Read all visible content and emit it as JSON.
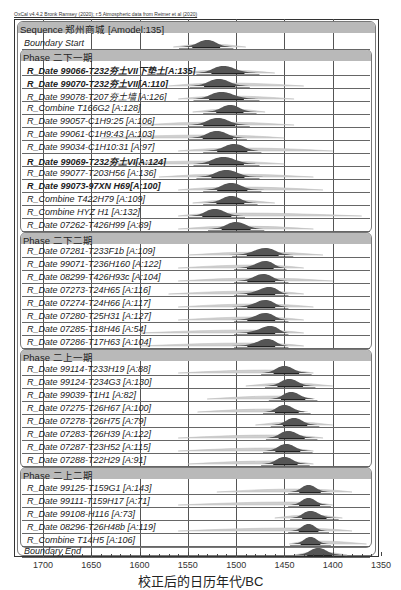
{
  "credit": "OxCal v4.4.2 Bronk Ramsey (2020); r:5 Atmospheric data from Reimer et al (2020)",
  "chart_data": {
    "type": "oxcal-multiplot",
    "xlabel": "校正后的日历年代/BC",
    "xlim": [
      1700,
      1350
    ],
    "ticks": [
      1700,
      1650,
      1600,
      1550,
      1500,
      1450,
      1400,
      1350
    ],
    "grid": true,
    "sequence": {
      "label": "Sequence 郑州商城 [Amodel:135]"
    },
    "rows": [
      {
        "kind": "boundary",
        "label": "Boundary Start",
        "y": 44,
        "center": 1530,
        "from": 1555,
        "to": 1507,
        "prior_from": 1565,
        "prior_to": 1490
      },
      {
        "kind": "phase",
        "label": "Phase 二下一期",
        "y": 56
      },
      {
        "kind": "date",
        "label": "R_Date 99066-T232夯土VII下垫土[A:135]",
        "bold": true,
        "y": 70,
        "center": 1513,
        "from": 1537,
        "to": 1480,
        "prior_from": 1560,
        "prior_to": 1460
      },
      {
        "kind": "date",
        "label": "R_Date 99070-T232夯土VII[A:110]",
        "bold": true,
        "y": 83,
        "center": 1518,
        "from": 1544,
        "to": 1490,
        "prior_from": 1570,
        "prior_to": 1430
      },
      {
        "kind": "date",
        "label": "R_Date 99078-T207夯土墙 [A:126]",
        "y": 96,
        "center": 1515,
        "from": 1540,
        "to": 1480,
        "prior_from": 1560,
        "prior_to": 1440
      },
      {
        "kind": "combine",
        "label": "R_Combine T166G2 [A:128]",
        "y": 109,
        "center": 1506,
        "from": 1530,
        "to": 1483,
        "prior_from": 1545,
        "prior_to": 1470
      },
      {
        "kind": "date",
        "label": "R_Date 99057-C1H9:25 [A:106]",
        "y": 122,
        "center": 1519,
        "from": 1545,
        "to": 1490,
        "prior_from": 1600,
        "prior_to": 1440
      },
      {
        "kind": "date",
        "label": "R_Date 99061-C1H9:43 [A:103]",
        "y": 135,
        "center": 1520,
        "from": 1545,
        "to": 1493,
        "prior_from": 1640,
        "prior_to": 1450
      },
      {
        "kind": "date",
        "label": "R_Date 99034-C1H10:31 [A:97]",
        "y": 148,
        "center": 1502,
        "from": 1530,
        "to": 1478,
        "prior_from": 1560,
        "prior_to": 1400
      },
      {
        "kind": "date",
        "label": "R_Date 99069-T232夯土VI[A:124]",
        "bold": true,
        "y": 161,
        "center": 1513,
        "from": 1540,
        "to": 1480,
        "prior_from": 1640,
        "prior_to": 1450
      },
      {
        "kind": "date",
        "label": "R_Date 99077-T203H56 [A:136]",
        "y": 174,
        "center": 1510,
        "from": 1537,
        "to": 1480,
        "prior_from": 1580,
        "prior_to": 1420
      },
      {
        "kind": "date",
        "label": "R_Date 99073-97XN H69[A:100]",
        "bold": true,
        "y": 187,
        "center": 1505,
        "from": 1530,
        "to": 1478,
        "prior_from": 1560,
        "prior_to": 1410
      },
      {
        "kind": "combine",
        "label": "R_Combine T422H79 [A:109]",
        "y": 200,
        "center": 1505,
        "from": 1530,
        "to": 1482,
        "prior_from": 1545,
        "prior_to": 1460
      },
      {
        "kind": "combine",
        "label": "R_Combine HYZ H1 [A:132]",
        "y": 213,
        "center": 1522,
        "from": 1545,
        "to": 1495,
        "prior_from": 1560,
        "prior_to": 1370
      },
      {
        "kind": "date",
        "label": "R_Date 07262-T426H99 [A:89]",
        "y": 226,
        "center": 1500,
        "from": 1525,
        "to": 1475,
        "prior_from": 1560,
        "prior_to": 1420
      },
      {
        "kind": "phase",
        "label": "Phase 二下二期",
        "y": 239
      },
      {
        "kind": "date",
        "label": "R_Date 07281-T233F1b [A:109]",
        "y": 252,
        "center": 1470,
        "from": 1500,
        "to": 1445,
        "prior_from": 1550,
        "prior_to": 1410
      },
      {
        "kind": "date",
        "label": "R_Date 99071-T236H160 [A:122]",
        "y": 265,
        "center": 1470,
        "from": 1498,
        "to": 1452,
        "prior_from": 1560,
        "prior_to": 1430
      },
      {
        "kind": "date",
        "label": "R_Date 08299-T426H93c [A:104]",
        "y": 278,
        "center": 1472,
        "from": 1498,
        "to": 1450,
        "prior_from": 1560,
        "prior_to": 1400
      },
      {
        "kind": "date",
        "label": "R_Date 07273-T24H65 [A:116]",
        "y": 291,
        "center": 1466,
        "from": 1498,
        "to": 1450,
        "prior_from": 1570,
        "prior_to": 1430
      },
      {
        "kind": "date",
        "label": "R_Date 07274-T24H66 [A:117]",
        "y": 304,
        "center": 1470,
        "from": 1498,
        "to": 1450,
        "prior_from": 1560,
        "prior_to": 1420
      },
      {
        "kind": "date",
        "label": "R_Date 07280-T25H31 [A:127]",
        "y": 317,
        "center": 1470,
        "from": 1498,
        "to": 1450,
        "prior_from": 1560,
        "prior_to": 1430
      },
      {
        "kind": "date",
        "label": "R_Date 07285-T18H46 [A:54]",
        "y": 330,
        "center": 1465,
        "from": 1498,
        "to": 1450,
        "prior_from": 1600,
        "prior_to": 1430
      },
      {
        "kind": "date",
        "label": "R_Date 07286-T17H63 [A:104]",
        "y": 343,
        "center": 1468,
        "from": 1498,
        "to": 1450,
        "prior_from": 1600,
        "prior_to": 1430
      },
      {
        "kind": "phase",
        "label": "Phase 二上一期",
        "y": 356
      },
      {
        "kind": "date",
        "label": "R_Date 99114-T233H19 [A:88]",
        "y": 370,
        "center": 1450,
        "from": 1470,
        "to": 1426,
        "prior_from": 1560,
        "prior_to": 1420
      },
      {
        "kind": "date",
        "label": "R_Date 99124-T234G3 [A:130]",
        "y": 383,
        "center": 1445,
        "from": 1466,
        "to": 1422,
        "prior_from": 1490,
        "prior_to": 1400
      },
      {
        "kind": "date",
        "label": "R_Date 99039-T1H1 [A:82]",
        "y": 396,
        "center": 1443,
        "from": 1462,
        "to": 1420,
        "prior_from": 1530,
        "prior_to": 1420
      },
      {
        "kind": "date",
        "label": "R_Date 07275-T26H67 [A:100]",
        "y": 409,
        "center": 1450,
        "from": 1468,
        "to": 1427,
        "prior_from": 1540,
        "prior_to": 1430
      },
      {
        "kind": "date",
        "label": "R_Date 07278-T26H75 [A:79]",
        "y": 422,
        "center": 1440,
        "from": 1460,
        "to": 1418,
        "prior_from": 1480,
        "prior_to": 1400
      },
      {
        "kind": "date",
        "label": "R_Date 07283-T26H39 [A:122]",
        "y": 435,
        "center": 1446,
        "from": 1465,
        "to": 1420,
        "prior_from": 1560,
        "prior_to": 1410
      },
      {
        "kind": "date",
        "label": "R_Date 07287-T23H52 [A:115]",
        "y": 448,
        "center": 1448,
        "from": 1468,
        "to": 1425,
        "prior_from": 1560,
        "prior_to": 1420
      },
      {
        "kind": "date",
        "label": "R_Date 07288-T22H29 [A:91]",
        "y": 461,
        "center": 1450,
        "from": 1470,
        "to": 1428,
        "prior_from": 1550,
        "prior_to": 1420
      },
      {
        "kind": "phase",
        "label": "Phase 二上二期",
        "y": 474
      },
      {
        "kind": "date",
        "label": "R_Date 99125-T159G1 [A:143]",
        "y": 489,
        "center": 1425,
        "from": 1442,
        "to": 1405,
        "prior_from": 1520,
        "prior_to": 1380
      },
      {
        "kind": "date",
        "label": "R_Date 99111-T159H17 [A:71]",
        "y": 502,
        "center": 1425,
        "from": 1442,
        "to": 1406,
        "prior_from": 1560,
        "prior_to": 1400
      },
      {
        "kind": "date",
        "label": "R_Date 99108-H116 [A:73]",
        "y": 515,
        "center": 1423,
        "from": 1440,
        "to": 1398,
        "prior_from": 1460,
        "prior_to": 1390
      },
      {
        "kind": "date",
        "label": "R_Date 08296-T26H48b [A:119]",
        "y": 528,
        "center": 1425,
        "from": 1442,
        "to": 1408,
        "prior_from": 1560,
        "prior_to": 1380
      },
      {
        "kind": "combine",
        "label": "R_Combine T14H5 [A:106]",
        "y": 541,
        "center": 1423,
        "from": 1440,
        "to": 1406,
        "prior_from": 1445,
        "prior_to": 1365
      },
      {
        "kind": "boundary",
        "label": "Boundary End",
        "y": 552,
        "center": 1415,
        "from": 1435,
        "to": 1392,
        "prior_from": 1440,
        "prior_to": 1385
      }
    ]
  }
}
